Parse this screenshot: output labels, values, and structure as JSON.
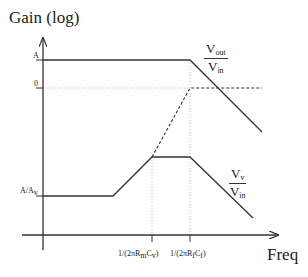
{
  "axes": {
    "y_label": "Gain (log)",
    "x_label": "Freq",
    "y_ticks": [
      {
        "label": "A",
        "level": "A"
      },
      {
        "label": "0",
        "level": "0"
      },
      {
        "label_main": "A/A",
        "label_sub": "v",
        "level": "A/Av"
      }
    ],
    "x_ticks": [
      {
        "label": "1/(2πR",
        "sub1": "m",
        "mid": "C",
        "sub2": "v",
        "end": ")"
      },
      {
        "label": "1/(2πR",
        "sub1": "f",
        "mid": "C",
        "sub2": "f",
        "end": ")"
      }
    ]
  },
  "curves": {
    "vout": {
      "num": "V",
      "num_sub": "out",
      "den": "V",
      "den_sub": "in"
    },
    "vv": {
      "num": "V",
      "num_sub": "v",
      "den": "V",
      "den_sub": "in"
    }
  },
  "colors": {
    "line": "#333333",
    "guide": "#999999",
    "background": "#ffffff"
  }
}
